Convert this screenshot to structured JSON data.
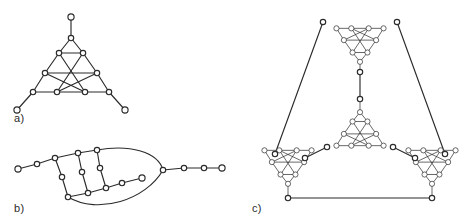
{
  "figure": {
    "type": "graph-diagram",
    "background_color": "#ffffff",
    "ink_color": "#2b2b2b",
    "node_fill_color": "#ffffff",
    "node_radius": 2.6,
    "stroke_width": 1.15,
    "labels": [
      {
        "id": "label-a",
        "text": "a)",
        "x": 14,
        "y": 122
      },
      {
        "id": "label-b",
        "text": "b)",
        "x": 14,
        "y": 212
      },
      {
        "id": "label-c",
        "text": "c)",
        "x": 252,
        "y": 212
      }
    ],
    "panels": [
      {
        "id": "panel-a",
        "label": "a)",
        "caption_id": "label-a",
        "node_count": 16,
        "edge_count": 21,
        "nodes": [
          {
            "id": "a-apex-top",
            "x": 71,
            "y": 17
          },
          {
            "id": "a-t",
            "x": 71,
            "y": 38
          },
          {
            "id": "a-tl",
            "x": 59,
            "y": 53
          },
          {
            "id": "a-tr",
            "x": 83,
            "y": 53
          },
          {
            "id": "a-ml",
            "x": 45,
            "y": 73
          },
          {
            "id": "a-mr",
            "x": 97,
            "y": 73
          },
          {
            "id": "a-bl",
            "x": 33,
            "y": 92
          },
          {
            "id": "a-bml",
            "x": 57,
            "y": 92
          },
          {
            "id": "a-bmr",
            "x": 85,
            "y": 92
          },
          {
            "id": "a-br",
            "x": 109,
            "y": 92
          },
          {
            "id": "a-leg-left",
            "x": 17,
            "y": 110
          },
          {
            "id": "a-leg-right",
            "x": 125,
            "y": 110
          }
        ],
        "edges": [
          [
            "a-apex-top",
            "a-t"
          ],
          [
            "a-t",
            "a-tl"
          ],
          [
            "a-t",
            "a-tr"
          ],
          [
            "a-tl",
            "a-tr"
          ],
          [
            "a-tl",
            "a-ml"
          ],
          [
            "a-tr",
            "a-mr"
          ],
          [
            "a-tl",
            "a-bmr"
          ],
          [
            "a-tr",
            "a-bml"
          ],
          [
            "a-ml",
            "a-mr"
          ],
          [
            "a-ml",
            "a-bl"
          ],
          [
            "a-mr",
            "a-br"
          ],
          [
            "a-ml",
            "a-bmr"
          ],
          [
            "a-mr",
            "a-bml"
          ],
          [
            "a-bl",
            "a-bml"
          ],
          [
            "a-bml",
            "a-bmr"
          ],
          [
            "a-bmr",
            "a-br"
          ],
          [
            "a-bl",
            "a-leg-left"
          ],
          [
            "a-br",
            "a-leg-right"
          ]
        ]
      },
      {
        "id": "panel-b",
        "label": "b)",
        "caption_id": "label-b",
        "node_count": 16,
        "edge_count": 18,
        "nodes": [
          {
            "id": "b-n1",
            "x": 18,
            "y": 169
          },
          {
            "id": "b-n2",
            "x": 37,
            "y": 164
          },
          {
            "id": "b-n3",
            "x": 55,
            "y": 158
          },
          {
            "id": "b-n4",
            "x": 78,
            "y": 153
          },
          {
            "id": "b-n5",
            "x": 97,
            "y": 150
          },
          {
            "id": "b-r1",
            "x": 62,
            "y": 177
          },
          {
            "id": "b-r2",
            "x": 82,
            "y": 172
          },
          {
            "id": "b-r3",
            "x": 100,
            "y": 168
          },
          {
            "id": "b-b1",
            "x": 68,
            "y": 197
          },
          {
            "id": "b-b2",
            "x": 88,
            "y": 193
          },
          {
            "id": "b-b3",
            "x": 106,
            "y": 188
          },
          {
            "id": "b-b0",
            "x": 68,
            "y": 197
          },
          {
            "id": "b-t1",
            "x": 122,
            "y": 183
          },
          {
            "id": "b-t2",
            "x": 142,
            "y": 178
          },
          {
            "id": "b-rjoin",
            "x": 163,
            "y": 170
          },
          {
            "id": "b-o1",
            "x": 184,
            "y": 168
          },
          {
            "id": "b-o2",
            "x": 204,
            "y": 168
          },
          {
            "id": "b-o3",
            "x": 222,
            "y": 168
          }
        ],
        "edges": [
          [
            "b-n1",
            "b-n2"
          ],
          [
            "b-n2",
            "b-n3"
          ],
          [
            "b-n3",
            "b-n4"
          ],
          [
            "b-n4",
            "b-n5"
          ],
          [
            "b-n3",
            "b-r1"
          ],
          [
            "b-n4",
            "b-r2"
          ],
          [
            "b-n5",
            "b-r3"
          ],
          [
            "b-r1",
            "b-b1"
          ],
          [
            "b-r2",
            "b-b2"
          ],
          [
            "b-r3",
            "b-b3"
          ],
          [
            "b-b1",
            "b-b2"
          ],
          [
            "b-b2",
            "b-b3"
          ],
          [
            "b-b3",
            "b-t1"
          ],
          [
            "b-t1",
            "b-t2"
          ],
          [
            "b-t2",
            "b-rjoin"
          ],
          [
            "b-rjoin",
            "b-o1"
          ],
          [
            "b-o1",
            "b-o2"
          ],
          [
            "b-o2",
            "b-o3"
          ]
        ],
        "curved_edges": [
          {
            "from": "b-n5",
            "to": "b-rjoin",
            "bulge": "upper"
          },
          {
            "from": "b-b1",
            "to": "b-rjoin",
            "bulge": "lower"
          }
        ]
      },
      {
        "id": "panel-c",
        "label": "c)",
        "caption_id": "label-c",
        "description": "Four copies of the panel-a triangular motif joined at their three legs; top motif inverted, centre motif upright, two lower motifs inverted",
        "clusters": [
          {
            "id": "c-cluster-top",
            "cx": 360,
            "cy": 46,
            "orientation": "down",
            "scale": 0.62
          },
          {
            "id": "c-cluster-center",
            "cx": 360,
            "cy": 128,
            "orientation": "up",
            "scale": 0.62
          },
          {
            "id": "c-cluster-left",
            "cx": 288,
            "cy": 168,
            "orientation": "down",
            "scale": 0.62
          },
          {
            "id": "c-cluster-right",
            "cx": 432,
            "cy": 168,
            "orientation": "down",
            "scale": 0.62
          }
        ],
        "linking_edges": [
          {
            "from": "c-cluster-top:leg-bottom",
            "to": "c-cluster-center:leg-top"
          },
          {
            "from": "c-cluster-top:leg-left",
            "to": "c-cluster-left:leg-top"
          },
          {
            "from": "c-cluster-top:leg-right",
            "to": "c-cluster-right:leg-top"
          },
          {
            "from": "c-cluster-center:leg-left",
            "to": "c-cluster-left:leg-right"
          },
          {
            "from": "c-cluster-center:leg-right",
            "to": "c-cluster-right:leg-left"
          },
          {
            "from": "c-cluster-left:leg-bottom",
            "to": "c-cluster-right:leg-bottom"
          }
        ]
      }
    ]
  }
}
